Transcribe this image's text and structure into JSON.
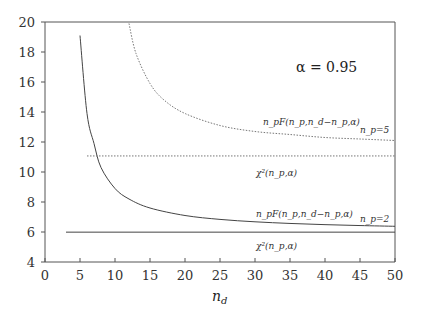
{
  "chart_data": {
    "type": "line",
    "title": "",
    "xlabel": "n_d",
    "ylabel": "",
    "xlim": [
      0,
      50
    ],
    "ylim": [
      4,
      20
    ],
    "xticks": [
      0,
      5,
      10,
      15,
      20,
      25,
      30,
      35,
      40,
      45,
      50
    ],
    "yticks": [
      4,
      6,
      8,
      10,
      12,
      14,
      16,
      18,
      20
    ],
    "grid": false,
    "annotations": {
      "alpha": "α = 0.95",
      "np5_label": "n_p=5",
      "np2_label": "n_p=2",
      "f_label_np5": "n_pF(n_p,n_d−n_p,α)",
      "chi_label_np5": "χ²(n_p,α)",
      "f_label_np2": "n_pF(n_p,n_d−n_p,α)",
      "chi_label_np2": "χ²(n_p,α)"
    },
    "series": [
      {
        "name": "n_p F(n_p, n_d - n_p, α), n_p=2",
        "style": "solid",
        "x": [
          5,
          6,
          7,
          8,
          10,
          12,
          15,
          20,
          25,
          30,
          35,
          40,
          45,
          50
        ],
        "y": [
          19.1,
          13.9,
          11.9,
          10.3,
          8.9,
          8.2,
          7.6,
          7.1,
          6.84,
          6.68,
          6.57,
          6.49,
          6.43,
          6.38
        ]
      },
      {
        "name": "χ²(n_p, α), n_p=2",
        "style": "solid",
        "x": [
          3,
          50
        ],
        "y": [
          5.99,
          5.99
        ]
      },
      {
        "name": "n_p F(n_p, n_d - n_p, α), n_p=5",
        "style": "dotted",
        "x": [
          12,
          13,
          15,
          17,
          20,
          25,
          30,
          35,
          40,
          45,
          50
        ],
        "y": [
          19.9,
          17.9,
          15.9,
          14.8,
          13.9,
          13.1,
          12.7,
          12.5,
          12.3,
          12.2,
          12.1
        ]
      },
      {
        "name": "χ²(n_p, α), n_p=5",
        "style": "dotted",
        "x": [
          6,
          50
        ],
        "y": [
          11.07,
          11.07
        ]
      }
    ]
  }
}
